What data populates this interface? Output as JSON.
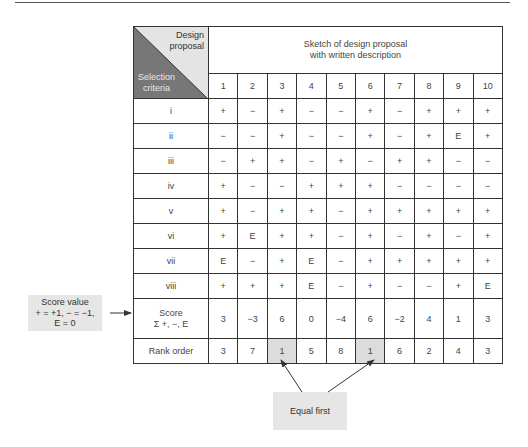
{
  "header": {
    "corner_top": "Design proposal",
    "corner_top_lines": [
      "Design",
      "proposal"
    ],
    "corner_bottom_lines": [
      "Selection",
      "criteria"
    ],
    "sketch_lines": [
      "Sketch of design proposal",
      "with written description"
    ]
  },
  "columns": [
    "1",
    "2",
    "3",
    "4",
    "5",
    "6",
    "7",
    "8",
    "9",
    "10"
  ],
  "rows": [
    {
      "criterion": "i",
      "values": [
        "+",
        "−",
        "+",
        "−",
        "−",
        "+",
        "−",
        "+",
        "+",
        "+"
      ]
    },
    {
      "criterion": "ii",
      "values": [
        "−",
        "−",
        "+",
        "−",
        "−",
        "+",
        "−",
        "+",
        "E",
        "+"
      ]
    },
    {
      "criterion": "iii",
      "values": [
        "−",
        "+",
        "+",
        "−",
        "+",
        "−",
        "+",
        "+",
        "−",
        "−"
      ]
    },
    {
      "criterion": "iv",
      "values": [
        "+",
        "−",
        "−",
        "+",
        "+",
        "+",
        "−",
        "−",
        "−",
        "−"
      ]
    },
    {
      "criterion": "v",
      "values": [
        "+",
        "−",
        "+",
        "+",
        "−",
        "+",
        "+",
        "+",
        "+",
        "+"
      ]
    },
    {
      "criterion": "vi",
      "values": [
        "+",
        "E",
        "+",
        "+",
        "−",
        "+",
        "−",
        "+",
        "−",
        "+"
      ]
    },
    {
      "criterion": "vii",
      "values": [
        "E",
        "−",
        "+",
        "E",
        "−",
        "+",
        "+",
        "+",
        "+",
        "+"
      ]
    },
    {
      "criterion": "viii",
      "values": [
        "+",
        "+",
        "+",
        "E",
        "−",
        "+",
        "−",
        "−",
        "+",
        "E"
      ]
    }
  ],
  "score": {
    "label_lines": [
      "Score",
      "Σ +, −, E"
    ],
    "values": [
      "3",
      "−3",
      "6",
      "0",
      "−4",
      "6",
      "−2",
      "4",
      "1",
      "3"
    ]
  },
  "rank": {
    "label": "Rank order",
    "values": [
      "3",
      "7",
      "1",
      "5",
      "8",
      "1",
      "6",
      "2",
      "4",
      "3"
    ],
    "highlighted_columns": [
      3,
      6
    ]
  },
  "annotations": {
    "score_value_lines": [
      "Score value",
      "+ = +1,  − = −1,",
      "E = 0"
    ],
    "equal_first": "Equal first"
  }
}
